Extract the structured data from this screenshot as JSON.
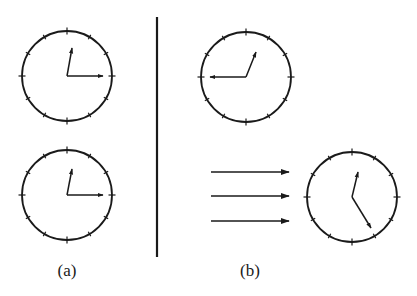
{
  "figure": {
    "stroke_color": "#1a1a1a",
    "divider": {
      "x": 157,
      "y1": 17,
      "y2": 257
    },
    "clocks": [
      {
        "id": "a-top",
        "panel": "a",
        "cx": 67,
        "cy": 76,
        "r": 45,
        "hour_tip": [
          72,
          48
        ],
        "minute_tip": [
          103,
          76
        ]
      },
      {
        "id": "a-bottom",
        "panel": "a",
        "cx": 67,
        "cy": 195,
        "r": 45,
        "hour_tip": [
          72,
          169
        ],
        "minute_tip": [
          103,
          195
        ]
      },
      {
        "id": "b-top",
        "panel": "b",
        "cx": 246,
        "cy": 77,
        "r": 45,
        "hour_tip": [
          256,
          52
        ],
        "minute_tip": [
          210,
          77
        ]
      },
      {
        "id": "b-bottom",
        "panel": "b",
        "cx": 352,
        "cy": 197,
        "r": 45,
        "hour_tip": [
          358,
          172
        ],
        "minute_tip": [
          371,
          228
        ]
      }
    ],
    "motion_arrows": [
      {
        "x1": 211,
        "x2": 289,
        "y": 172
      },
      {
        "x1": 211,
        "x2": 289,
        "y": 196
      },
      {
        "x1": 211,
        "x2": 289,
        "y": 221
      }
    ],
    "labels": {
      "a": "(a)",
      "b": "(b)"
    }
  }
}
